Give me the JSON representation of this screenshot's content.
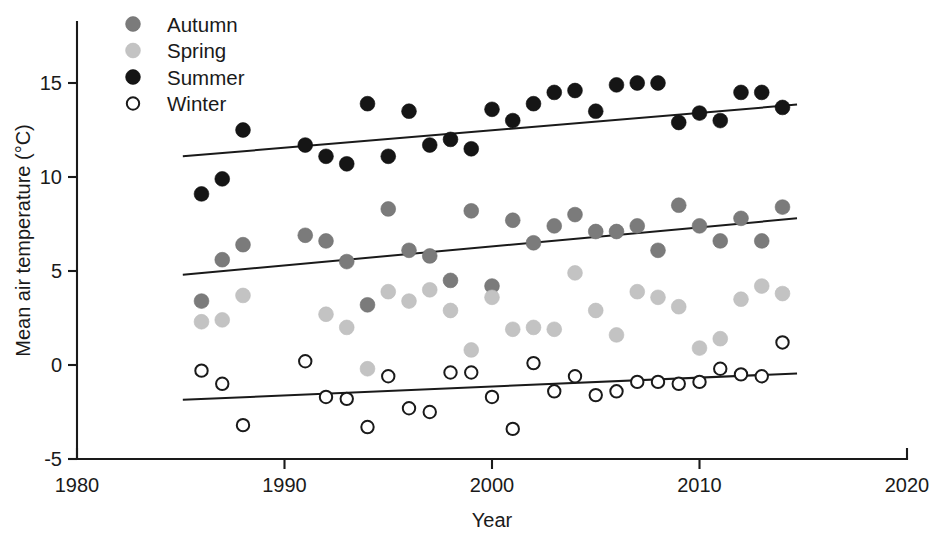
{
  "chart_data": {
    "type": "scatter",
    "title": "",
    "xlabel": "Year",
    "ylabel": "Mean air temperature (°C)",
    "xlim": [
      1980,
      2020
    ],
    "ylim": [
      -5,
      17.2
    ],
    "xticks": [
      1980,
      1990,
      2000,
      2010,
      2020
    ],
    "xtick_labels": [
      "1980",
      "1990",
      "2000",
      "2010",
      "2020"
    ],
    "yticks": [
      -5,
      0,
      5,
      10,
      15
    ],
    "ytick_labels": [
      "-5",
      "0",
      "5",
      "10",
      "15"
    ],
    "grid": false,
    "legend_position": "top-left",
    "series": [
      {
        "name": "Autumn",
        "marker": "filled-circle",
        "color": "#7b7b7b",
        "points": [
          {
            "x": 1986,
            "y": 3.4
          },
          {
            "x": 1987,
            "y": 5.6
          },
          {
            "x": 1988,
            "y": 6.4
          },
          {
            "x": 1991,
            "y": 6.9
          },
          {
            "x": 1992,
            "y": 6.6
          },
          {
            "x": 1993,
            "y": 5.5
          },
          {
            "x": 1994,
            "y": 3.2
          },
          {
            "x": 1995,
            "y": 8.3
          },
          {
            "x": 1996,
            "y": 6.1
          },
          {
            "x": 1997,
            "y": 5.8
          },
          {
            "x": 1998,
            "y": 4.5
          },
          {
            "x": 1999,
            "y": 8.2
          },
          {
            "x": 2000,
            "y": 4.2
          },
          {
            "x": 2001,
            "y": 7.7
          },
          {
            "x": 2002,
            "y": 6.5
          },
          {
            "x": 2003,
            "y": 7.4
          },
          {
            "x": 2004,
            "y": 8.0
          },
          {
            "x": 2005,
            "y": 7.1
          },
          {
            "x": 2006,
            "y": 7.1
          },
          {
            "x": 2007,
            "y": 7.4
          },
          {
            "x": 2008,
            "y": 6.1
          },
          {
            "x": 2009,
            "y": 8.5
          },
          {
            "x": 2010,
            "y": 7.4
          },
          {
            "x": 2011,
            "y": 6.6
          },
          {
            "x": 2012,
            "y": 7.8
          },
          {
            "x": 2013,
            "y": 6.6
          },
          {
            "x": 2014,
            "y": 8.4
          }
        ],
        "trend": {
          "x0": 1985.1,
          "y0": 4.8,
          "x1": 2014.7,
          "y1": 7.8
        }
      },
      {
        "name": "Spring",
        "marker": "filled-circle",
        "color": "#c3c3c3",
        "points": [
          {
            "x": 1986,
            "y": 2.3
          },
          {
            "x": 1987,
            "y": 2.4
          },
          {
            "x": 1988,
            "y": 3.7
          },
          {
            "x": 1992,
            "y": 2.7
          },
          {
            "x": 1993,
            "y": 2.0
          },
          {
            "x": 1994,
            "y": -0.2
          },
          {
            "x": 1995,
            "y": 3.9
          },
          {
            "x": 1996,
            "y": 3.4
          },
          {
            "x": 1997,
            "y": 4.0
          },
          {
            "x": 1998,
            "y": 2.9
          },
          {
            "x": 1999,
            "y": 0.8
          },
          {
            "x": 2000,
            "y": 3.6
          },
          {
            "x": 2001,
            "y": 1.9
          },
          {
            "x": 2002,
            "y": 2.0
          },
          {
            "x": 2003,
            "y": 1.9
          },
          {
            "x": 2004,
            "y": 4.9
          },
          {
            "x": 2005,
            "y": 2.9
          },
          {
            "x": 2006,
            "y": 1.6
          },
          {
            "x": 2007,
            "y": 3.9
          },
          {
            "x": 2008,
            "y": 3.6
          },
          {
            "x": 2009,
            "y": 3.1
          },
          {
            "x": 2010,
            "y": 0.9
          },
          {
            "x": 2011,
            "y": 1.4
          },
          {
            "x": 2012,
            "y": 3.5
          },
          {
            "x": 2013,
            "y": 4.2
          },
          {
            "x": 2014,
            "y": 3.8
          }
        ]
      },
      {
        "name": "Summer",
        "marker": "filled-circle",
        "color": "#151515",
        "points": [
          {
            "x": 1986,
            "y": 9.1
          },
          {
            "x": 1987,
            "y": 9.9
          },
          {
            "x": 1988,
            "y": 12.5
          },
          {
            "x": 1991,
            "y": 11.7
          },
          {
            "x": 1992,
            "y": 11.1
          },
          {
            "x": 1993,
            "y": 10.7
          },
          {
            "x": 1994,
            "y": 13.9
          },
          {
            "x": 1995,
            "y": 11.1
          },
          {
            "x": 1996,
            "y": 13.5
          },
          {
            "x": 1997,
            "y": 11.7
          },
          {
            "x": 1998,
            "y": 12.0
          },
          {
            "x": 1999,
            "y": 11.5
          },
          {
            "x": 2000,
            "y": 13.6
          },
          {
            "x": 2001,
            "y": 13.0
          },
          {
            "x": 2002,
            "y": 13.9
          },
          {
            "x": 2003,
            "y": 14.5
          },
          {
            "x": 2004,
            "y": 14.6
          },
          {
            "x": 2005,
            "y": 13.5
          },
          {
            "x": 2006,
            "y": 14.9
          },
          {
            "x": 2007,
            "y": 15.0
          },
          {
            "x": 2008,
            "y": 15.0
          },
          {
            "x": 2009,
            "y": 12.9
          },
          {
            "x": 2010,
            "y": 13.4
          },
          {
            "x": 2011,
            "y": 13.0
          },
          {
            "x": 2012,
            "y": 14.5
          },
          {
            "x": 2013,
            "y": 14.5
          },
          {
            "x": 2014,
            "y": 13.7
          }
        ],
        "trend": {
          "x0": 1985.1,
          "y0": 11.1,
          "x1": 2014.7,
          "y1": 13.85
        }
      },
      {
        "name": "Winter",
        "marker": "open-circle",
        "color": "#ffffff",
        "points": [
          {
            "x": 1986,
            "y": -0.3
          },
          {
            "x": 1987,
            "y": -1.0
          },
          {
            "x": 1988,
            "y": -3.2
          },
          {
            "x": 1991,
            "y": 0.2
          },
          {
            "x": 1992,
            "y": -1.7
          },
          {
            "x": 1993,
            "y": -1.8
          },
          {
            "x": 1994,
            "y": -3.3
          },
          {
            "x": 1995,
            "y": -0.6
          },
          {
            "x": 1996,
            "y": -2.3
          },
          {
            "x": 1997,
            "y": -2.5
          },
          {
            "x": 1998,
            "y": -0.4
          },
          {
            "x": 1999,
            "y": -0.4
          },
          {
            "x": 2000,
            "y": -1.7
          },
          {
            "x": 2001,
            "y": -3.4
          },
          {
            "x": 2002,
            "y": 0.1
          },
          {
            "x": 2003,
            "y": -1.4
          },
          {
            "x": 2004,
            "y": -0.6
          },
          {
            "x": 2005,
            "y": -1.6
          },
          {
            "x": 2006,
            "y": -1.4
          },
          {
            "x": 2007,
            "y": -0.9
          },
          {
            "x": 2008,
            "y": -0.9
          },
          {
            "x": 2009,
            "y": -1.0
          },
          {
            "x": 2010,
            "y": -0.9
          },
          {
            "x": 2011,
            "y": -0.2
          },
          {
            "x": 2012,
            "y": -0.5
          },
          {
            "x": 2013,
            "y": -0.6
          },
          {
            "x": 2014,
            "y": 1.2
          }
        ],
        "trend": {
          "x0": 1985.1,
          "y0": -1.85,
          "x1": 2014.7,
          "y1": -0.45
        }
      }
    ]
  },
  "legend": {
    "entries": [
      {
        "label": "Autumn",
        "marker": "filled-circle",
        "color": "#7b7b7b"
      },
      {
        "label": "Spring",
        "marker": "filled-circle",
        "color": "#c3c3c3"
      },
      {
        "label": "Summer",
        "marker": "filled-circle",
        "color": "#151515"
      },
      {
        "label": "Winter",
        "marker": "open-circle",
        "color": "#ffffff"
      }
    ]
  }
}
